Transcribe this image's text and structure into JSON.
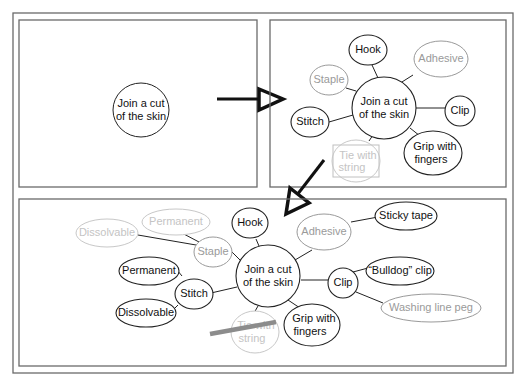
{
  "colors": {
    "frame": "#6a6a6a",
    "dark": "#111111",
    "grey": "#9a9a9a",
    "light": "#c4c4c4",
    "strike": "#8c8c8c"
  },
  "panel1": {
    "center": "Join a cut of the skin",
    "center_lines": [
      "Join a cut",
      "of the skin"
    ]
  },
  "panel2": {
    "center_lines": [
      "Join a cut",
      "of the skin"
    ],
    "nodes": [
      {
        "id": "hook",
        "label": "Hook",
        "style": "dark"
      },
      {
        "id": "adhesive",
        "label": "Adhesive",
        "style": "grey"
      },
      {
        "id": "staple",
        "label": "Staple",
        "style": "grey"
      },
      {
        "id": "clip",
        "label": "Clip",
        "style": "dark"
      },
      {
        "id": "stitch",
        "label": "Stitch",
        "style": "dark"
      },
      {
        "id": "grip",
        "label": "Grip with fingers",
        "lines": [
          "Grip with",
          "fingers"
        ],
        "style": "dark"
      },
      {
        "id": "tie",
        "label": "Tie with string",
        "lines": [
          "Tie with",
          "string"
        ],
        "style": "light",
        "boxed": true
      }
    ]
  },
  "panel3": {
    "center_lines": [
      "Join a cut",
      "of the skin"
    ],
    "nodes": [
      {
        "id": "hook",
        "label": "Hook",
        "style": "dark"
      },
      {
        "id": "adhesive",
        "label": "Adhesive",
        "style": "grey"
      },
      {
        "id": "sticky",
        "label": "Sticky tape",
        "style": "dark"
      },
      {
        "id": "staple",
        "label": "Staple",
        "style": "grey"
      },
      {
        "id": "permanent_staple",
        "label": "Permanent",
        "style": "light"
      },
      {
        "id": "dissolvable_staple",
        "label": "Dissolvable",
        "style": "light"
      },
      {
        "id": "stitch",
        "label": "Stitch",
        "style": "dark"
      },
      {
        "id": "permanent_stitch",
        "label": "Permanent",
        "style": "dark"
      },
      {
        "id": "dissolvable_stitch",
        "label": "Dissolvable",
        "style": "dark"
      },
      {
        "id": "clip",
        "label": "Clip",
        "style": "dark"
      },
      {
        "id": "bulldog",
        "label": "“Bulldog” clip",
        "style": "dark"
      },
      {
        "id": "peg",
        "label": "Washing line peg",
        "style": "grey"
      },
      {
        "id": "grip",
        "label": "Grip with fingers",
        "lines": [
          "Grip with",
          "fingers"
        ],
        "style": "dark"
      },
      {
        "id": "tie",
        "label": "Tie with string",
        "lines": [
          "Tie with",
          "string"
        ],
        "style": "light",
        "struck": true
      }
    ]
  },
  "arrows": [
    {
      "from": "panel1",
      "to": "panel2",
      "direction": "right"
    },
    {
      "from": "panel2",
      "to": "panel3",
      "direction": "down-left"
    }
  ]
}
